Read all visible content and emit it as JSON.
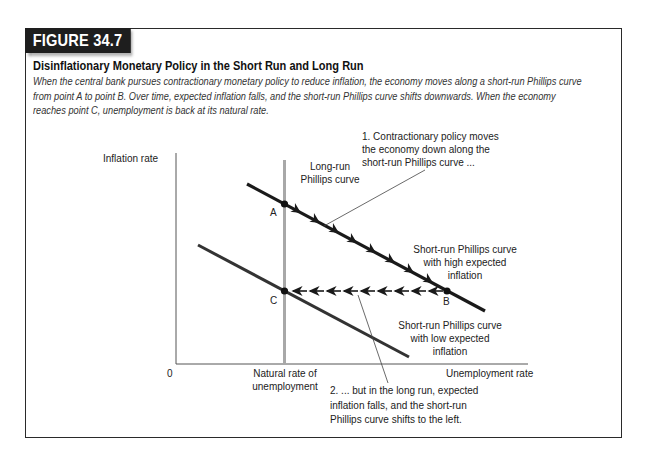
{
  "figure": {
    "number": "FIGURE 34.7",
    "title": "Disinflationary Monetary Policy in the Short Run and Long Run",
    "caption_lines": [
      "When the central bank pursues contractionary monetary policy to reduce inflation, the economy moves along a short-run Phillips curve",
      "from point A to point B. Over time, expected inflation falls, and the short-run Phillips curve shifts downwards. When the economy",
      "reaches point C, unemployment is back at its natural rate."
    ]
  },
  "diagram": {
    "y_axis_label": "Inflation rate",
    "x_axis_label": "Unemployment rate",
    "origin_label": "0",
    "natural_rate_label": [
      "Natural rate of",
      "unemployment"
    ],
    "lrpc_label": [
      "Long-run",
      "Phillips curve"
    ],
    "srpc_high_label": [
      "Short-run Phillips curve",
      "with high expected",
      "inflation"
    ],
    "srpc_low_label": [
      "Short-run Phillips curve",
      "with low expected",
      "inflation"
    ],
    "points": {
      "A": "A",
      "B": "B",
      "C": "C"
    },
    "annotation_1": [
      "1. Contractionary policy moves",
      "the economy down along the",
      "short-run Phillips curve ..."
    ],
    "annotation_2": [
      "2. ... but in the long run, expected",
      "inflation falls, and the short-run",
      "Phillips curve shifts to the left."
    ],
    "colors": {
      "curve": "#1a1a1a",
      "lower_curve": "#333333",
      "lrpc": "#a8a8a8",
      "axis": "#555555",
      "tab_bg": "#1e1e1e"
    }
  }
}
